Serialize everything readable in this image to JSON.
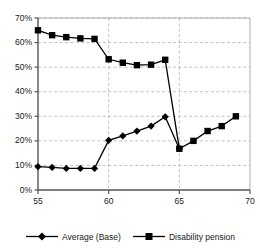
{
  "chart_data": {
    "type": "line",
    "title": "",
    "xlabel": "",
    "ylabel": "",
    "xlim": [
      55,
      70
    ],
    "ylim": [
      0,
      70
    ],
    "xticks": [
      55,
      60,
      65,
      70
    ],
    "yticks": [
      0,
      10,
      20,
      30,
      40,
      50,
      60,
      70
    ],
    "ytick_labels": [
      "0%",
      "10%",
      "20%",
      "30%",
      "40%",
      "50%",
      "60%",
      "70%"
    ],
    "xtick_labels": [
      "55",
      "60",
      "65",
      "70"
    ],
    "grid": "horizontal-and-vertical-dashed",
    "legend_position": "bottom-center",
    "series": [
      {
        "name": "Average (Base)",
        "marker": "diamond",
        "color": "#000000",
        "x": [
          55,
          56,
          57,
          58,
          59,
          60,
          61,
          62,
          63,
          64,
          65
        ],
        "values": [
          9.5,
          9.2,
          8.8,
          8.8,
          8.8,
          20.2,
          22.0,
          24.0,
          26.0,
          29.8,
          16.8
        ]
      },
      {
        "name": "Disability pension",
        "marker": "square",
        "color": "#000000",
        "x": [
          55,
          56,
          57,
          58,
          59,
          60,
          61,
          62,
          63,
          64,
          65,
          66,
          67,
          68,
          69
        ],
        "values": [
          65.0,
          63.0,
          62.2,
          61.7,
          61.5,
          53.2,
          51.8,
          50.8,
          51.0,
          53.0,
          16.8,
          20.0,
          24.0,
          26.0,
          30.0
        ]
      }
    ]
  },
  "legend": {
    "items": [
      {
        "label": "Average (Base)",
        "marker": "diamond-marker"
      },
      {
        "label": "Disability pension",
        "marker": "square-marker"
      }
    ]
  }
}
